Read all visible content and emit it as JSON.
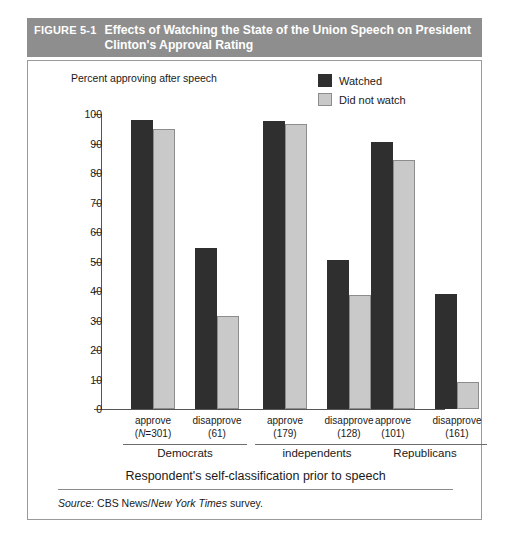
{
  "figure": {
    "number": "FIGURE 5-1",
    "title": "Effects of Watching the State of the Union Speech on President Clinton's Approval Rating"
  },
  "legend": {
    "items": [
      {
        "label": "Watched",
        "color": "#2f2f2f"
      },
      {
        "label": "Did not watch",
        "color": "#c9c9c9"
      }
    ]
  },
  "source": {
    "label": "Source:",
    "pre": "CBS News/",
    "publication": "New York Times",
    "post": "survey."
  },
  "chart_data": {
    "type": "bar",
    "title": "Effects of Watching the State of the Union Speech on President Clinton's Approval Rating",
    "ylabel": "Percent approving after speech",
    "xlabel": "Respondent's self-classification prior to speech",
    "ylim": [
      0,
      100
    ],
    "yticks": [
      100,
      90,
      80,
      70,
      60,
      50,
      40,
      30,
      20,
      10,
      0
    ],
    "grid": false,
    "legend_position": "top-right",
    "groups": [
      {
        "name": "Democrats",
        "categories": [
          {
            "label": "approve",
            "n_text": "(N=301)",
            "n": 301
          },
          {
            "label": "disapprove",
            "n_text": "(61)",
            "n": 61
          }
        ]
      },
      {
        "name": "independents",
        "categories": [
          {
            "label": "approve",
            "n_text": "(179)",
            "n": 179
          },
          {
            "label": "disapprove",
            "n_text": "(128)",
            "n": 128
          }
        ]
      },
      {
        "name": "Republicans",
        "categories": [
          {
            "label": "approve",
            "n_text": "(101)",
            "n": 101
          },
          {
            "label": "disapprove",
            "n_text": "(161)",
            "n": 161
          }
        ]
      }
    ],
    "categories": [
      "Democrats / approve (N=301)",
      "Democrats / disapprove (61)",
      "independents / approve (179)",
      "independents / disapprove (128)",
      "Republicans / approve (101)",
      "Republicans / disapprove (161)"
    ],
    "series": [
      {
        "name": "Watched",
        "color": "#2f2f2f",
        "values": [
          98,
          54.5,
          97.5,
          50.5,
          90.5,
          39
        ]
      },
      {
        "name": "Did not watch",
        "color": "#c9c9c9",
        "values": [
          95,
          31.5,
          96.5,
          38.5,
          84.5,
          9
        ]
      }
    ]
  }
}
